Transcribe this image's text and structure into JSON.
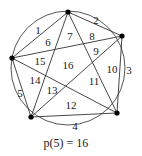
{
  "diagram": {
    "circle": {
      "cx": 68,
      "cy": 68,
      "r": 57
    },
    "points": [
      {
        "id": "top",
        "x": 68,
        "y": 12
      },
      {
        "id": "right",
        "x": 122,
        "y": 36
      },
      {
        "id": "bottom-right",
        "x": 117,
        "y": 113
      },
      {
        "id": "bottom-left",
        "x": 31,
        "y": 117
      },
      {
        "id": "left",
        "x": 12,
        "y": 58
      }
    ],
    "regions": [
      {
        "label": "1",
        "x": 38,
        "y": 31
      },
      {
        "label": "2",
        "x": 96,
        "y": 21
      },
      {
        "label": "3",
        "x": 129,
        "y": 71
      },
      {
        "label": "4",
        "x": 75,
        "y": 127
      },
      {
        "label": "5",
        "x": 20,
        "y": 94
      },
      {
        "label": "6",
        "x": 48,
        "y": 43
      },
      {
        "label": "7",
        "x": 70,
        "y": 37
      },
      {
        "label": "8",
        "x": 92,
        "y": 37
      },
      {
        "label": "9",
        "x": 96,
        "y": 52
      },
      {
        "label": "10",
        "x": 112,
        "y": 70
      },
      {
        "label": "11",
        "x": 94,
        "y": 82
      },
      {
        "label": "12",
        "x": 71,
        "y": 106
      },
      {
        "label": "13",
        "x": 52,
        "y": 91
      },
      {
        "label": "14",
        "x": 35,
        "y": 81
      },
      {
        "label": "15",
        "x": 40,
        "y": 62
      },
      {
        "label": "16",
        "x": 68,
        "y": 66
      }
    ],
    "caption": "p(5) = 16",
    "caption_pos": {
      "x": 66,
      "y": 144
    }
  }
}
